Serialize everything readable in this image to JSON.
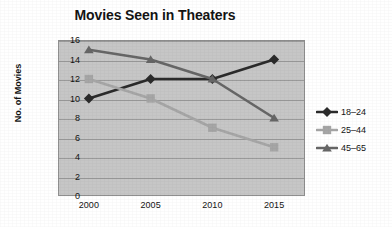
{
  "chart_data": {
    "type": "line",
    "title": "Movies Seen in Theaters",
    "xlabel": "",
    "ylabel": "No. of Movies",
    "categories": [
      "2000",
      "2005",
      "2010",
      "2015"
    ],
    "ylim": [
      0,
      16
    ],
    "ytick_labels": [
      "0",
      "2",
      "4",
      "6",
      "8",
      "10",
      "12",
      "14",
      "16"
    ],
    "ytick_values": [
      0,
      2,
      4,
      6,
      8,
      10,
      12,
      14,
      16
    ],
    "grid": true,
    "legend_position": "right",
    "plot_background": "#c6c6c6",
    "series": [
      {
        "name": "18–24",
        "values": [
          10,
          12,
          12,
          14
        ],
        "color": "#2b2b2b",
        "marker": "diamond"
      },
      {
        "name": "25–44",
        "values": [
          12,
          10,
          7,
          5
        ],
        "color": "#a6a6a6",
        "marker": "square"
      },
      {
        "name": "45–65",
        "values": [
          15,
          14,
          12,
          8
        ],
        "color": "#666666",
        "marker": "triangle"
      }
    ]
  },
  "legend": {
    "entries": [
      {
        "label": "18–24"
      },
      {
        "label": "25–44"
      },
      {
        "label": "45–65"
      }
    ]
  },
  "axes": {
    "y_title": "No. of Movies"
  }
}
